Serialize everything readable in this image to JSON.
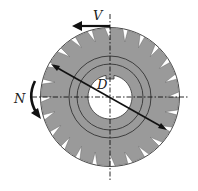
{
  "diagram": {
    "labels": {
      "velocity": "V",
      "rotation": "N",
      "diameter": "D"
    },
    "cutter": {
      "teeth_count": 24,
      "fill_color": "#9a9a9a",
      "outline_color": "#333333"
    },
    "colors": {
      "background": "#ffffff",
      "line": "#111111"
    }
  }
}
